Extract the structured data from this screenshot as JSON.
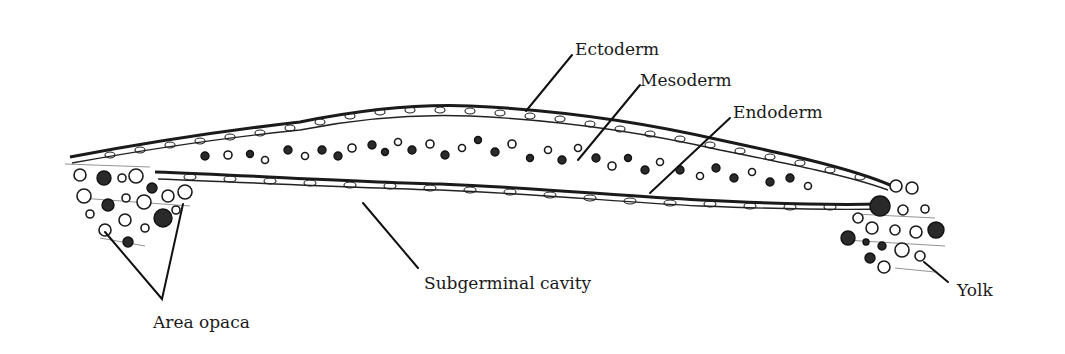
{
  "figure": {
    "type": "embryology cross-section diagram",
    "stroke_color": "#111111",
    "background_color": "#ffffff"
  },
  "labels": {
    "ectoderm": "Ectoderm",
    "mesoderm": "Mesoderm",
    "endoderm": "Endoderm",
    "subgerminal_cavity": "Subgerminal cavity",
    "area_opaca": "Area opaca",
    "yolk": "Yolk"
  }
}
